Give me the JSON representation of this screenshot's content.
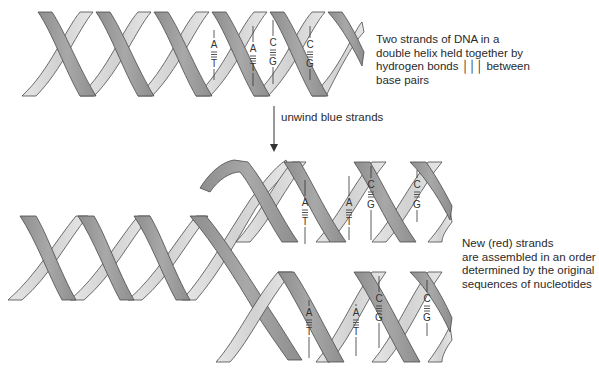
{
  "diagram": {
    "colors": {
      "front_strand": "#9c9c9c",
      "back_strand": "#dcdcdc",
      "outline": "#4a4a4a",
      "text": "#2a2a2a"
    },
    "top_helix": {
      "caption": "Two strands of DNA in a\ndouble helix held together by\nhydrogen bonds │││ between\nbase pairs",
      "base_pairs": [
        {
          "top": "A",
          "bottom": "T",
          "bonds": "≡"
        },
        {
          "top": "A",
          "bottom": "T",
          "bonds": "≡"
        },
        {
          "top": "C",
          "bottom": "G",
          "bonds": "≡"
        },
        {
          "top": "C",
          "bottom": "G",
          "bonds": "≡"
        }
      ]
    },
    "step_arrow": {
      "label": "unwind blue strands"
    },
    "upper_daughter_helix": {
      "base_pairs": [
        {
          "top": "A",
          "bottom": "T"
        },
        {
          "top": "A",
          "bottom": "T"
        },
        {
          "top": "C",
          "bottom": "G"
        },
        {
          "top": "C",
          "bottom": "G"
        }
      ]
    },
    "lower_daughter_helix": {
      "base_pairs": [
        {
          "top": "A",
          "bottom": "T"
        },
        {
          "top": "A",
          "bottom": "T"
        },
        {
          "top": "C",
          "bottom": "G"
        },
        {
          "top": "C",
          "bottom": "G"
        }
      ]
    },
    "bottom_caption": "New (red) strands\nare assembled in an order\ndetermined by the original\nsequences of nucleotides"
  }
}
